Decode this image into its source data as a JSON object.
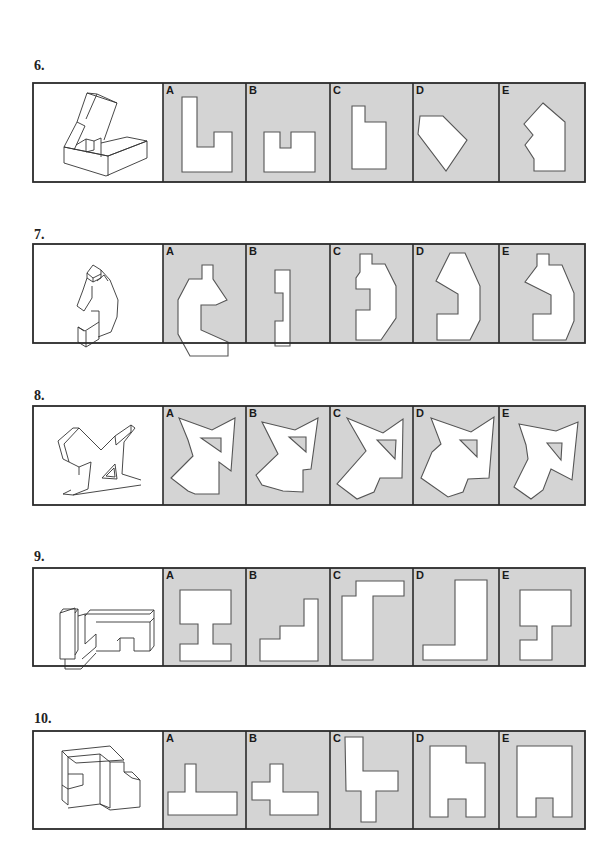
{
  "colors": {
    "option_bg": "#d4d4d4",
    "frame": "#2a2a2a",
    "shape_fill": "#ffffff",
    "shape_stroke": "#555555",
    "iso_stroke": "#333333"
  },
  "layout": {
    "box_left": 33,
    "box_right": 585,
    "columns": [
      33,
      163,
      246,
      330,
      413,
      499,
      585
    ]
  },
  "questions": [
    {
      "number": "6.",
      "label_y": 58,
      "top": 83,
      "bottom": 182,
      "iso_figure": [
        "M64 147 L64 163 L106 176 L147 158 L147 141 L108 156 Z",
        "M64 147 L108 156 L147 141",
        "M108 156 L108 176",
        "M64 147 L77 122 L85 126 L74 150",
        "M77 122 L87 93 L97 94 L86 119",
        "M87 93 L117 103 L104 140",
        "M97 94 L117 103",
        "M76 145 L86 139 L94 141 L94 150 L86 152",
        "M86 139 L86 152",
        "M94 141 L101 138 L101 157",
        "M101 143 L127 137 L147 141"
      ],
      "options": [
        {
          "letter": "A",
          "paths": [
            "M182 96 L198 96 L198 145 L230 145 L230 136 L233 136 L233 178 L182 178 Z"
          ],
          "shape": "M182 97 L197 97 L197 147 L214 147 L214 132 L232 132 L232 172 L182 172 Z"
        },
        {
          "letter": "B",
          "shape": "M264 132 L280 132 L280 148 L291 148 L291 132 L315 132 L315 172 L264 172 Z"
        },
        {
          "letter": "C",
          "shape": "M352 106 L365 106 L365 122 L386 122 L386 169 L352 169 Z"
        },
        {
          "letter": "D",
          "shape": "M420 116 L443 116 L467 140 L446 171 L418 134 Z"
        },
        {
          "letter": "E",
          "shape": "M543 103 L565 122 L565 171 L534 171 L534 159 L525 145 L533 135 L524 124 Z"
        }
      ]
    },
    {
      "number": "7.",
      "label_y": 227,
      "top": 244,
      "bottom": 343,
      "iso_figure": [
        "M87 273 L93 265 L101 270 L101 278 L93 282 L87 278 Z",
        "M87 273 L93 278 L101 274",
        "M93 278 L93 282",
        "M87 278 L83 290 L77 306 L84 311 L92 298 L92 286",
        "M101 270 L110 280 L118 300 L117 317 L111 332 L98 337",
        "M97 281 L104 275 L108 281",
        "M91 311 L99 311 L99 322 L85 331 L78 327",
        "M78 327 L78 342 L86 347 L99 339 L99 322",
        "M86 331 L86 347",
        "M78 327 L84 331"
      ],
      "options": [
        {
          "letter": "A",
          "shape": "M202 265 L213 265 L213 279 L227 300 L216 305 L201 305 L201 330 L228 342 L228 356 L190 356 L178 334 L178 300 L189 279 L202 279 Z"
        },
        {
          "letter": "B",
          "shape": "M275 270 L290 270 L290 346 L275 346 L275 321 L283 321 L283 293 L275 293 Z"
        },
        {
          "letter": "C",
          "shape": "M360 254 L372 254 L372 264 L385 264 L396 286 L396 318 L381 340 L356 340 L356 310 L370 310 L370 289 L356 289 L356 278 L360 272 Z"
        },
        {
          "letter": "D",
          "shape": "M450 253 L465 253 L480 286 L480 320 L470 340 L437 340 L437 314 L458 314 L458 294 L436 281 Z"
        },
        {
          "letter": "E",
          "shape": "M537 254 L549 254 L549 265 L562 265 L574 293 L574 321 L566 340 L533 340 L533 314 L551 314 L551 295 L525 282 L537 266 Z"
        }
      ]
    },
    {
      "number": "8.",
      "label_y": 388,
      "top": 406,
      "bottom": 505,
      "iso_figure": [
        "M73 428 L58 441 L63 459 L79 467",
        "M79 428 L64 444 L69 462",
        "M73 428 L79 428 L101 450 L115 436 L131 425 L135 428",
        "M135 428 L124 442 L122 474 L141 480",
        "M115 436 L116 445 L131 432 L131 425",
        "M79 467 L91 462 L88 489 L73 495 L63 494 L71 490",
        "M79 467 L79 475",
        "M73 495 L141 485",
        "M102 478 L115 464 L117 479 Z",
        "M106 476 L114 468 L115 477 Z"
      ],
      "options": [
        {
          "letter": "A",
          "shape": "M179 418 L212 430 L235 418 L231 471 L219 462 L219 494 L195 494 L188 491 L171 478 L193 456 L188 440 Z"
        },
        {
          "letter": "A_hole",
          "shape": "M201 438 L221 438 L221 452 Z"
        },
        {
          "letter": "B",
          "shape": "M262 422 L295 430 L318 418 L311 469 L303 470 L303 492 L283 491 L262 485 L256 475 L278 454 Z"
        },
        {
          "letter": "B_hole",
          "shape": "M289 437 L306 437 L306 452 Z"
        },
        {
          "letter": "C",
          "shape": "M347 418 L383 433 L403 419 L402 478 L380 478 L374 492 L357 499 L337 484 L366 451 Z"
        },
        {
          "letter": "C_hole",
          "shape": "M377 440 L396 440 L395 459 Z"
        },
        {
          "letter": "D",
          "shape": "M431 418 L471 432 L494 417 L489 478 L468 479 L463 492 L448 497 L421 478 L432 452 L441 444 Z"
        },
        {
          "letter": "D_hole",
          "shape": "M460 440 L477 440 L477 457 Z"
        },
        {
          "letter": "E",
          "shape": "M519 424 L556 431 L578 422 L572 480 L551 469 L543 490 L531 499 L514 487 L528 459 L526 445 Z"
        },
        {
          "letter": "E_hole",
          "shape": "M547 443 L562 443 L561 460 Z"
        }
      ]
    },
    {
      "number": "9.",
      "label_y": 549,
      "top": 568,
      "bottom": 666,
      "iso_figure": [
        "M60 613 L60 659 L75 659 L75 608 Z",
        "M60 613 L63 609 L78 609 L75 613",
        "M78 609 L78 650 L75 655",
        "M78 616 L85 614 L85 644 L96 634 L96 647 L82 659",
        "M65 659 L65 669 L81 669 L96 653",
        "M85 614 L150 614 L154 610 L90 610 L85 616",
        "M96 622 L150 622 L150 651 L134 651 L134 638 L120 638 L120 651 L96 651",
        "M150 622 L154 618 L154 646 L150 651",
        "M117 641 L120 638",
        "M154 610 L154 618"
      ],
      "options": [
        {
          "letter": "A",
          "shape": "M180 590 L231 590 L231 624 L213 624 L213 644 L231 644 L231 661 L180 661 L180 644 L198 644 L198 624 L180 624 Z"
        },
        {
          "letter": "B",
          "shape": "M304 599 L318 599 L318 661 L260 661 L260 639 L280 639 L280 626 L304 626 Z"
        },
        {
          "letter": "C",
          "shape": "M356 581 L404 581 L404 596 L373 596 L373 660 L342 660 L342 596 L356 596 Z"
        },
        {
          "letter": "D",
          "shape": "M455 580 L487 580 L487 660 L423 660 L423 645 L455 645 Z"
        },
        {
          "letter": "E",
          "shape": "M520 590 L571 590 L571 626 L552 626 L552 660 L520 660 L520 640 L537 640 L537 626 L520 626 Z"
        }
      ]
    },
    {
      "number": "10.",
      "label_y": 711,
      "top": 731,
      "bottom": 829,
      "iso_figure": [
        "M62 751 L62 800 L68 805 L68 757 Z",
        "M62 751 L110 746 L124 760 L76 763 L68 757",
        "M68 757 L100 754",
        "M68 774 L83 774 L83 785 L68 789",
        "M62 785 L68 789",
        "M100 754 L100 804 L68 808",
        "M100 754 L110 762 L110 808 L100 804",
        "M110 762 L124 762 L124 772 L132 772 L140 780 L140 807 L110 810",
        "M124 772 L132 778 L140 780",
        "M110 810 L100 804"
      ],
      "options": [
        {
          "letter": "A",
          "shape": "M185 764 L196 764 L196 792 L237 792 L237 815 L168 815 L168 792 L185 792 Z"
        },
        {
          "letter": "B",
          "shape": "M270 764 L283 764 L283 792 L318 792 L318 815 L270 815 L270 800 L252 800 L252 782 L270 782 Z"
        },
        {
          "letter": "C",
          "shape": "M345 737 L363 737 L363 771 L398 771 L398 791 L376 791 L376 822 L361 822 L361 791 L346 791 Z"
        },
        {
          "letter": "D",
          "shape": "M430 746 L466 746 L466 763 L485 763 L485 817 L466 817 L466 799 L448 799 L448 817 L430 817 Z"
        },
        {
          "letter": "E",
          "shape": "M517 746 L572 746 L572 817 L553 817 L553 798 L536 798 L536 817 L517 817 Z"
        }
      ]
    }
  ]
}
